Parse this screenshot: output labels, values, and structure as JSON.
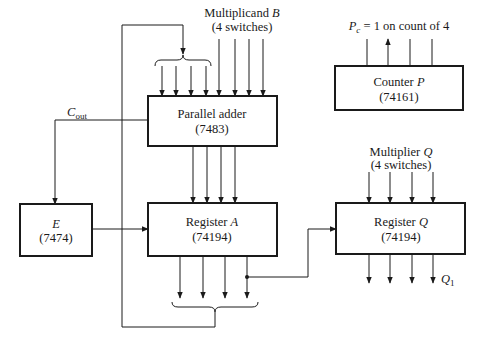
{
  "diagram": {
    "type": "block-diagram",
    "title": "",
    "blocks": {
      "parallel_adder": {
        "name": "Parallel adder",
        "chip": "(7483)"
      },
      "register_a": {
        "name": "Register",
        "var": "A",
        "chip": "(74194)"
      },
      "e_flipflop": {
        "var": "E",
        "chip": "(7474)"
      },
      "counter_p": {
        "name": "Counter",
        "var": "P",
        "chip": "(74161)"
      },
      "register_q": {
        "name": "Register",
        "var": "Q",
        "chip": "(74194)"
      }
    },
    "labels": {
      "multiplicand_line1_text": "Multiplicand",
      "multiplicand_var": "B",
      "multiplicand_line2": "(4 switches)",
      "multiplier_line1_text": "Multiplier",
      "multiplier_var": "Q",
      "multiplier_line2": "(4 switches)",
      "counter_output_var": "P",
      "counter_output_sub": "c",
      "counter_output_text": " = 1 on count of 4",
      "carry_var": "C",
      "carry_sub": "out",
      "q1_var": "Q",
      "q1_sub": "1"
    },
    "colors": {
      "line": "#1a1a1a",
      "background": "#ffffff"
    }
  }
}
